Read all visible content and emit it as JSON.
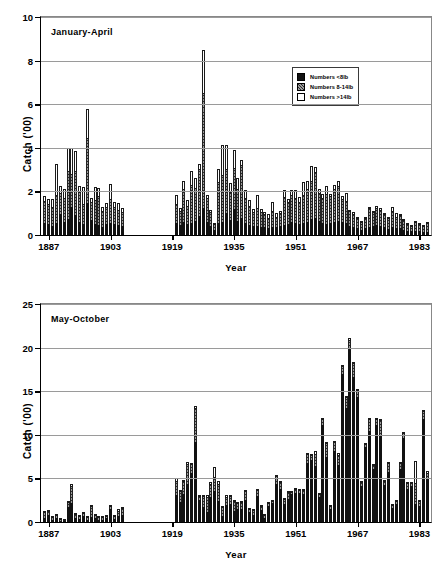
{
  "figure": {
    "width": 444,
    "height": 574,
    "background": "#ffffff",
    "ink": "#000000",
    "grid_color": "#9a9a9a"
  },
  "legend": {
    "position": "inside-top-right",
    "entries": [
      {
        "label": "Numbers <8lb",
        "key": "small",
        "fill": "#111111",
        "pattern": "solid-black"
      },
      {
        "label": "Numbers 8-14lb",
        "key": "mid",
        "fill": "#9b9b9b",
        "pattern": "diagonal-hatch"
      },
      {
        "label": "Numbers >14lb",
        "key": "large",
        "fill": "#ffffff",
        "pattern": "open-white"
      }
    ]
  },
  "chart_data": [
    {
      "id": "january-april",
      "type": "bar",
      "stacked": true,
      "title": "January-April",
      "xlabel": "Year",
      "ylabel": "Catch ('00)",
      "ylim": [
        0,
        10
      ],
      "yticks": [
        0,
        2,
        4,
        6,
        8,
        10
      ],
      "xlim": [
        1885,
        1986
      ],
      "xticks": [
        1887,
        1903,
        1919,
        1935,
        1951,
        1967,
        1983
      ],
      "grid": "horizontal",
      "series_order": [
        "small",
        "mid",
        "large"
      ],
      "series": [
        {
          "name": "Numbers <8lb",
          "key": "small"
        },
        {
          "name": "Numbers 8-14lb",
          "key": "mid"
        },
        {
          "name": "Numbers >14lb",
          "key": "large"
        }
      ],
      "years": [
        1886,
        1887,
        1888,
        1889,
        1890,
        1891,
        1892,
        1893,
        1894,
        1895,
        1896,
        1897,
        1898,
        1899,
        1900,
        1901,
        1902,
        1903,
        1904,
        1905,
        1906,
        1920,
        1921,
        1922,
        1923,
        1924,
        1925,
        1926,
        1927,
        1928,
        1929,
        1930,
        1931,
        1932,
        1933,
        1934,
        1935,
        1936,
        1937,
        1938,
        1939,
        1940,
        1941,
        1942,
        1943,
        1944,
        1945,
        1946,
        1947,
        1948,
        1949,
        1950,
        1951,
        1952,
        1953,
        1954,
        1955,
        1956,
        1957,
        1958,
        1959,
        1960,
        1961,
        1962,
        1963,
        1964,
        1965,
        1966,
        1967,
        1968,
        1969,
        1970,
        1971,
        1972,
        1973,
        1974,
        1975,
        1976,
        1977,
        1978,
        1979,
        1980,
        1981,
        1982,
        1983,
        1984,
        1985
      ],
      "values_small": [
        0.55,
        0.5,
        0.4,
        0.55,
        0.95,
        0.6,
        0.75,
        1.3,
        0.9,
        0.6,
        0.5,
        1.45,
        0.7,
        0.5,
        0.45,
        0.35,
        0.5,
        0.55,
        0.5,
        0.45,
        0.4,
        0.55,
        0.45,
        0.6,
        0.5,
        0.55,
        0.65,
        0.85,
        1.25,
        0.6,
        0.4,
        0.25,
        0.55,
        0.6,
        1.0,
        0.7,
        1.2,
        0.65,
        0.8,
        0.55,
        0.45,
        0.4,
        0.4,
        0.35,
        0.35,
        0.3,
        0.35,
        0.35,
        0.4,
        0.45,
        0.5,
        0.6,
        0.55,
        0.5,
        0.55,
        0.6,
        0.75,
        0.8,
        0.65,
        0.55,
        0.5,
        0.55,
        0.6,
        0.65,
        0.6,
        0.55,
        0.4,
        0.35,
        0.3,
        0.25,
        0.3,
        0.35,
        0.4,
        0.45,
        0.4,
        0.35,
        0.3,
        0.35,
        0.3,
        0.3,
        0.25,
        0.2,
        0.18,
        0.2,
        0.18,
        0.15,
        0.15
      ],
      "values_mid": [
        0.95,
        0.9,
        0.85,
        1.25,
        0.95,
        1.05,
        2.15,
        1.45,
        2.0,
        1.35,
        0.9,
        2.95,
        0.75,
        1.05,
        1.3,
        0.7,
        0.75,
        1.05,
        0.75,
        0.65,
        0.6,
        0.85,
        0.6,
        1.45,
        0.8,
        1.7,
        1.45,
        2.15,
        5.2,
        1.05,
        0.6,
        0.25,
        1.85,
        2.1,
        2.0,
        1.25,
        1.85,
        1.4,
        2.35,
        1.1,
        0.85,
        0.6,
        0.8,
        0.65,
        0.55,
        0.45,
        0.7,
        0.45,
        0.55,
        1.25,
        0.95,
        1.2,
        1.1,
        0.95,
        1.25,
        1.45,
        1.7,
        2.05,
        1.25,
        1.1,
        1.35,
        1.2,
        1.45,
        1.55,
        1.0,
        0.95,
        0.65,
        0.55,
        0.45,
        0.35,
        0.45,
        0.85,
        0.6,
        0.75,
        0.7,
        0.55,
        0.45,
        0.7,
        0.5,
        0.55,
        0.4,
        0.3,
        0.25,
        0.4,
        0.3,
        0.25,
        0.35
      ],
      "values_large": [
        0.3,
        0.25,
        0.4,
        1.45,
        0.35,
        0.45,
        1.1,
        1.25,
        0.95,
        0.3,
        0.8,
        1.4,
        0.25,
        0.65,
        0.4,
        0.25,
        0.2,
        0.75,
        0.25,
        0.35,
        0.25,
        0.45,
        0.2,
        0.45,
        0.3,
        0.7,
        0.5,
        0.25,
        2.05,
        0.2,
        0.15,
        0.05,
        0.65,
        1.45,
        1.15,
        0.45,
        0.85,
        0.55,
        0.3,
        0.4,
        0.3,
        0.2,
        0.65,
        0.2,
        0.15,
        0.2,
        0.45,
        0.2,
        0.15,
        0.35,
        0.2,
        0.25,
        0.4,
        0.3,
        0.65,
        0.45,
        0.7,
        0.25,
        0.2,
        0.25,
        0.4,
        0.15,
        0.25,
        0.3,
        0.2,
        0.45,
        0.1,
        0.15,
        0.1,
        0.05,
        0.1,
        0.1,
        0.08,
        0.15,
        0.15,
        0.1,
        0.08,
        0.25,
        0.2,
        0.1,
        0.1,
        0.05,
        0.05,
        0.05,
        0.05,
        0.05,
        0.1
      ]
    },
    {
      "id": "may-october",
      "type": "bar",
      "stacked": true,
      "title": "May-October",
      "xlabel": "Year",
      "ylabel": "Catch ('00)",
      "ylim": [
        0,
        25
      ],
      "yticks": [
        0,
        5,
        10,
        15,
        20,
        25
      ],
      "xlim": [
        1885,
        1986
      ],
      "xticks": [
        1887,
        1903,
        1919,
        1935,
        1951,
        1967,
        1983
      ],
      "grid": "horizontal",
      "series_order": [
        "small",
        "mid",
        "large"
      ],
      "series": [
        {
          "name": "Numbers <8lb",
          "key": "small"
        },
        {
          "name": "Numbers 8-14lb",
          "key": "mid"
        },
        {
          "name": "Numbers >14lb",
          "key": "large"
        }
      ],
      "years": [
        1886,
        1887,
        1888,
        1889,
        1890,
        1891,
        1892,
        1893,
        1894,
        1895,
        1896,
        1897,
        1898,
        1899,
        1900,
        1901,
        1902,
        1903,
        1904,
        1905,
        1906,
        1920,
        1921,
        1922,
        1923,
        1924,
        1925,
        1926,
        1927,
        1928,
        1929,
        1930,
        1931,
        1932,
        1933,
        1934,
        1935,
        1936,
        1937,
        1938,
        1939,
        1940,
        1941,
        1942,
        1943,
        1944,
        1945,
        1946,
        1947,
        1948,
        1949,
        1950,
        1951,
        1952,
        1953,
        1954,
        1955,
        1956,
        1957,
        1958,
        1959,
        1960,
        1961,
        1962,
        1963,
        1964,
        1965,
        1966,
        1967,
        1968,
        1969,
        1970,
        1971,
        1972,
        1973,
        1974,
        1975,
        1976,
        1977,
        1978,
        1979,
        1980,
        1981,
        1982,
        1983,
        1984,
        1985
      ],
      "values_small": [
        0.45,
        0.95,
        0.35,
        0.45,
        0.25,
        0.15,
        1.75,
        2.15,
        0.55,
        0.4,
        0.7,
        0.35,
        0.55,
        0.45,
        0.3,
        0.35,
        0.55,
        1.65,
        0.45,
        0.65,
        0.8,
        3.1,
        2.3,
        3.2,
        4.4,
        5.6,
        9.2,
        2.6,
        1.75,
        1.2,
        2.9,
        3.6,
        2.4,
        0.75,
        1.95,
        2.1,
        1.3,
        1.6,
        1.55,
        2.55,
        1.2,
        0.85,
        2.95,
        1.4,
        0.6,
        1.95,
        2.3,
        4.4,
        3.85,
        2.1,
        2.7,
        3.35,
        3.45,
        3.35,
        3.25,
        6.8,
        7.1,
        6.4,
        2.95,
        11.2,
        7.5,
        1.6,
        8.2,
        6.55,
        17.1,
        13.1,
        19.9,
        16.7,
        14.4,
        4.3,
        8.7,
        10.4,
        6.15,
        11.2,
        9.9,
        4.3,
        5.8,
        1.7,
        2.2,
        6.2,
        9.7,
        3.8,
        4.25,
        2.1,
        1.95,
        11.9,
        4.9
      ],
      "values_mid": [
        0.65,
        0.35,
        0.25,
        0.3,
        0.2,
        0.15,
        0.55,
        1.85,
        0.35,
        0.25,
        0.35,
        0.25,
        1.15,
        0.35,
        0.25,
        0.25,
        0.2,
        0.25,
        0.25,
        0.55,
        0.65,
        1.5,
        1.1,
        1.35,
        2.15,
        0.95,
        3.8,
        0.4,
        1.15,
        1.6,
        1.35,
        1.45,
        1.85,
        0.85,
        0.85,
        0.75,
        0.95,
        0.55,
        0.75,
        0.85,
        0.25,
        0.45,
        0.65,
        0.45,
        0.25,
        0.25,
        0.15,
        0.75,
        0.65,
        0.45,
        0.7,
        0.15,
        0.25,
        0.25,
        0.35,
        0.85,
        0.55,
        1.25,
        0.2,
        0.65,
        1.45,
        0.25,
        0.85,
        1.05,
        0.75,
        1.2,
        0.85,
        1.45,
        0.7,
        0.25,
        0.25,
        1.25,
        0.35,
        0.55,
        1.65,
        0.35,
        0.85,
        0.25,
        0.25,
        0.55,
        0.45,
        0.65,
        0.25,
        2.25,
        0.45,
        0.75,
        0.65
      ],
      "values_large": [
        0.2,
        0.1,
        0.1,
        0.15,
        0.05,
        0.05,
        0.15,
        0.4,
        0.15,
        0.1,
        0.15,
        0.1,
        0.25,
        0.15,
        0.1,
        0.1,
        0.05,
        0.1,
        0.1,
        0.25,
        0.25,
        0.45,
        0.25,
        0.25,
        0.3,
        0.25,
        0.35,
        0.15,
        0.25,
        0.3,
        0.3,
        1.25,
        0.45,
        0.2,
        0.25,
        0.2,
        0.25,
        0.15,
        0.15,
        0.25,
        0.1,
        0.15,
        0.2,
        0.15,
        0.1,
        0.1,
        0.1,
        0.2,
        0.2,
        0.15,
        0.2,
        0.1,
        0.15,
        0.15,
        0.15,
        0.25,
        0.2,
        0.45,
        0.15,
        0.1,
        0.2,
        0.1,
        0.25,
        0.3,
        0.15,
        0.2,
        0.3,
        0.2,
        0.15,
        0.1,
        0.15,
        0.25,
        0.15,
        0.2,
        0.25,
        0.15,
        0.2,
        0.1,
        0.1,
        0.15,
        0.2,
        0.15,
        0.1,
        2.6,
        0.15,
        0.15,
        0.25
      ]
    }
  ]
}
